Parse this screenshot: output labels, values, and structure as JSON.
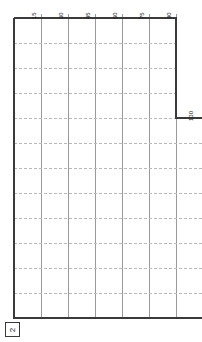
{
  "drawing": {
    "title": "Stepped grid plan",
    "sheet_marker": {
      "label": "2",
      "icon": "boxed-number-marker"
    },
    "colors": {
      "outline": "#3a3a3a",
      "vertical_grid": "#9a9a9a",
      "horizontal_grid": "#b9b9b9",
      "background": "#ffffff",
      "text": "#1a1a1a"
    },
    "top_axis": {
      "labels": [
        "15",
        "30",
        "45",
        "60",
        "75",
        "90"
      ],
      "orientation": "rotated-90"
    },
    "right_axis": {
      "labels": [
        "100"
      ],
      "orientation": "rotated-90"
    },
    "grid": {
      "column_count": 6,
      "row_count": 12,
      "column_spacing": 27,
      "row_spacing": 25
    }
  }
}
